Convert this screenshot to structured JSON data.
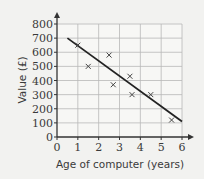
{
  "chart_data": {
    "type": "scatter",
    "title": "",
    "xlabel": "Age of computer (years)",
    "ylabel": "Value (£)",
    "xlim": [
      0,
      6
    ],
    "ylim": [
      0,
      800
    ],
    "xticks": [
      0,
      1,
      2,
      3,
      4,
      5,
      6
    ],
    "yticks": [
      0,
      100,
      200,
      300,
      400,
      500,
      600,
      700,
      800
    ],
    "grid": true,
    "legend": null,
    "marker": "x",
    "series": [
      {
        "name": "computers",
        "points": [
          {
            "x": 1,
            "y": 650
          },
          {
            "x": 1.5,
            "y": 500
          },
          {
            "x": 2.5,
            "y": 580
          },
          {
            "x": 2.7,
            "y": 370
          },
          {
            "x": 3.5,
            "y": 430
          },
          {
            "x": 3.6,
            "y": 300
          },
          {
            "x": 4.5,
            "y": 300
          },
          {
            "x": 5.5,
            "y": 120
          }
        ]
      }
    ],
    "line_of_best_fit": {
      "x1": 0.5,
      "y1": 700,
      "x2": 6,
      "y2": 110
    }
  },
  "colors": {
    "background": "#f2f2f0",
    "grid": "#b8b8b8",
    "axis": "#333333",
    "marker": "#444444",
    "line": "#222222"
  }
}
